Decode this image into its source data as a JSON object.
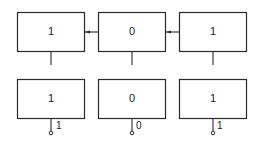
{
  "diagram": {
    "top_row": {
      "cells": [
        {
          "value": "1"
        },
        {
          "value": "0"
        },
        {
          "value": "1"
        }
      ],
      "connections": [
        {
          "from": 1,
          "to": 0,
          "direction": "left"
        },
        {
          "from": 2,
          "to": 1,
          "direction": "left"
        }
      ]
    },
    "bottom_row": {
      "cells": [
        {
          "value": "1",
          "output_label": "1"
        },
        {
          "value": "0",
          "output_label": "0"
        },
        {
          "value": "1",
          "output_label": "1"
        }
      ]
    }
  }
}
